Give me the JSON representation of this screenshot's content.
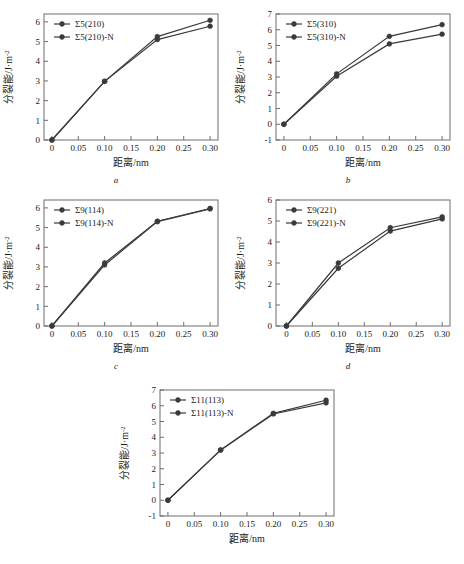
{
  "figure": {
    "axis_titles": {
      "x": "距离/nm",
      "y": "分裂能/J·m",
      "y_superscript": "-2"
    },
    "panels": [
      {
        "id": "a",
        "caption": "a",
        "chart_index": 0
      },
      {
        "id": "b",
        "caption": "b",
        "chart_index": 1
      },
      {
        "id": "c",
        "caption": "c",
        "chart_index": 2
      },
      {
        "id": "d",
        "caption": "d",
        "chart_index": 3
      },
      {
        "id": "e",
        "caption": "e",
        "chart_index": 4
      }
    ]
  },
  "chart_data": [
    {
      "type": "line",
      "title": "",
      "panel_label": "a",
      "xlabel": "距离/nm",
      "ylabel": "分裂能/J·m⁻²",
      "x": [
        0,
        0.1,
        0.2,
        0.3
      ],
      "xlim": [
        -0.015,
        0.315
      ],
      "ylim": [
        0,
        6.4
      ],
      "xticks": [
        0,
        0.05,
        0.1,
        0.15,
        0.2,
        0.25,
        0.3
      ],
      "xticklabels": [
        "0",
        "0.05",
        "0.10",
        "0.15",
        "0.20",
        "0.25",
        "0.30"
      ],
      "yticks": [
        0,
        1,
        2,
        3,
        4,
        5,
        6
      ],
      "yticklabels": [
        "0",
        "1",
        "2",
        "3",
        "4",
        "5",
        "6"
      ],
      "grid": false,
      "legend_position": "upper left",
      "series": [
        {
          "name": "Σ5(210)",
          "values": [
            0.0,
            2.98,
            5.1,
            5.78
          ]
        },
        {
          "name": "Σ5(210)-N",
          "values": [
            0.0,
            2.98,
            5.25,
            6.08
          ]
        }
      ]
    },
    {
      "type": "line",
      "title": "",
      "panel_label": "b",
      "xlabel": "距离/nm",
      "ylabel": "分裂能/J·m⁻²",
      "x": [
        0,
        0.1,
        0.2,
        0.3
      ],
      "xlim": [
        -0.015,
        0.315
      ],
      "ylim": [
        -1,
        7
      ],
      "xticks": [
        0,
        0.05,
        0.1,
        0.15,
        0.2,
        0.25,
        0.3
      ],
      "xticklabels": [
        "0",
        "0.05",
        "0.10",
        "0.15",
        "0.20",
        "0.25",
        "0.30"
      ],
      "yticks": [
        -1,
        0,
        1,
        2,
        3,
        4,
        5,
        6,
        7
      ],
      "yticklabels": [
        "-1",
        "0",
        "1",
        "2",
        "3",
        "4",
        "5",
        "6",
        "7"
      ],
      "grid": false,
      "legend_position": "upper left",
      "series": [
        {
          "name": "Σ5(310)",
          "values": [
            0.0,
            3.05,
            5.1,
            5.72
          ]
        },
        {
          "name": "Σ5(310)-N",
          "values": [
            0.0,
            3.2,
            5.58,
            6.32
          ]
        }
      ]
    },
    {
      "type": "line",
      "title": "",
      "panel_label": "c",
      "xlabel": "距离/nm",
      "ylabel": "分裂能/J·m⁻²",
      "x": [
        0,
        0.1,
        0.2,
        0.3
      ],
      "xlim": [
        -0.015,
        0.315
      ],
      "ylim": [
        0,
        6.4
      ],
      "xticks": [
        0,
        0.05,
        0.1,
        0.15,
        0.2,
        0.25,
        0.3
      ],
      "xticklabels": [
        "0",
        "0.05",
        "0.10",
        "0.15",
        "0.20",
        "0.25",
        "0.30"
      ],
      "yticks": [
        0,
        1,
        2,
        3,
        4,
        5,
        6
      ],
      "yticklabels": [
        "0",
        "1",
        "2",
        "3",
        "4",
        "5",
        "6"
      ],
      "grid": false,
      "legend_position": "upper left",
      "series": [
        {
          "name": "Σ9(114)",
          "values": [
            0.0,
            3.1,
            5.3,
            5.95
          ]
        },
        {
          "name": "Σ9(114)-N",
          "values": [
            0.0,
            3.2,
            5.32,
            5.97
          ]
        }
      ]
    },
    {
      "type": "line",
      "title": "",
      "panel_label": "d",
      "xlabel": "距离/nm",
      "ylabel": "分裂能/J·m⁻²",
      "x": [
        0,
        0.1,
        0.2,
        0.3
      ],
      "xlim": [
        -0.02,
        0.315
      ],
      "ylim": [
        0,
        6
      ],
      "xticks": [
        0,
        0.05,
        0.1,
        0.15,
        0.2,
        0.25,
        0.3
      ],
      "xticklabels": [
        "0",
        "0.05",
        "0.10",
        "0.15",
        "0.20",
        "0.25",
        "0.30"
      ],
      "yticks": [
        0,
        1,
        2,
        3,
        4,
        5,
        6
      ],
      "yticklabels": [
        "0",
        "1",
        "2",
        "3",
        "4",
        "5",
        "6"
      ],
      "grid": false,
      "legend_position": "upper left",
      "series": [
        {
          "name": "Σ9(221)",
          "values": [
            0.0,
            2.75,
            4.52,
            5.1
          ]
        },
        {
          "name": "Σ9(221)-N",
          "values": [
            0.0,
            3.0,
            4.68,
            5.2
          ]
        }
      ]
    },
    {
      "type": "line",
      "title": "",
      "panel_label": "e",
      "xlabel": "距离/nm",
      "ylabel": "分裂能/J·m⁻²",
      "x": [
        0,
        0.1,
        0.2,
        0.3
      ],
      "xlim": [
        -0.015,
        0.315
      ],
      "ylim": [
        -1,
        7
      ],
      "xticks": [
        0,
        0.05,
        0.1,
        0.15,
        0.2,
        0.25,
        0.3
      ],
      "xticklabels": [
        "0",
        "0.05",
        "0.10",
        "0.15",
        "0.20",
        "0.25",
        "0.30"
      ],
      "yticks": [
        -1,
        0,
        1,
        2,
        3,
        4,
        5,
        6,
        7
      ],
      "yticklabels": [
        "-1",
        "0",
        "1",
        "2",
        "3",
        "4",
        "5",
        "6",
        "7"
      ],
      "grid": false,
      "legend_position": "upper left",
      "series": [
        {
          "name": "Σ11(113)",
          "values": [
            0.0,
            3.18,
            5.48,
            6.18
          ]
        },
        {
          "name": "Σ11(113)-N",
          "values": [
            0.0,
            3.2,
            5.52,
            6.35
          ]
        }
      ]
    }
  ],
  "style": {
    "series_color": "#3a3a3a",
    "axis_color": "#6d6d6d",
    "background": "#ffffff"
  }
}
